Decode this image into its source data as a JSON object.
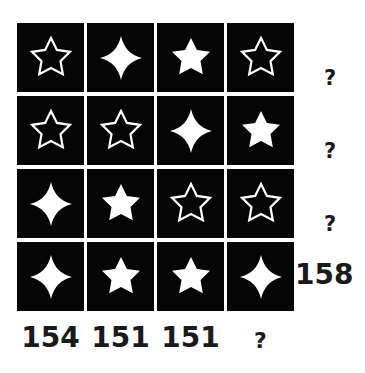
{
  "puzzle": {
    "grid": [
      [
        "star-outline",
        "diamond",
        "star-filled",
        "star-outline"
      ],
      [
        "star-outline",
        "star-outline",
        "diamond",
        "star-filled"
      ],
      [
        "diamond",
        "star-filled",
        "star-outline",
        "star-outline"
      ],
      [
        "diamond",
        "star-filled",
        "star-filled",
        "diamond"
      ]
    ],
    "row_sums": [
      "?",
      "?",
      "?",
      "158"
    ],
    "col_sums": [
      "154",
      "151",
      "151",
      "?"
    ],
    "colors": {
      "cell_bg": "#050505",
      "shape": "#ffffff",
      "page_bg": "#ffffff",
      "text": "#1a1a1a"
    }
  }
}
